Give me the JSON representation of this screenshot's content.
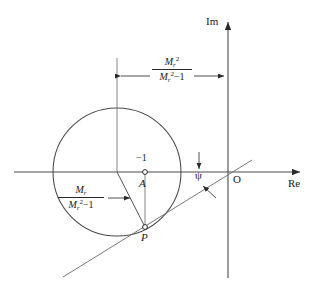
{
  "figure": {
    "background": "#ffffff",
    "stroke_color": "#3a3a3a",
    "text_color": "#1a1a1a"
  },
  "axes": {
    "imaginary": {
      "label": "Im",
      "arrow": "up-arrow-icon"
    },
    "real": {
      "label": "Re",
      "arrow": "right-arrow-icon"
    },
    "origin_label": "O"
  },
  "points": {
    "center": {
      "label": "A",
      "value_label": "−1",
      "marker": "open-circle"
    },
    "tangent": {
      "label": "P",
      "marker": "open-circle"
    }
  },
  "angle": {
    "symbol": "ψ"
  },
  "dimensions": {
    "horizontal": {
      "numerator_base": "M",
      "numerator_sub": "r",
      "numerator_sup": "2",
      "denominator_base": "M",
      "denominator_sub": "r",
      "denominator_sup": "2",
      "denominator_tail": "−1",
      "meaning": "M_r^2 / (M_r^2 - 1)"
    },
    "radius": {
      "numerator_base": "M",
      "numerator_sub": "r",
      "denominator_base": "M",
      "denominator_sub": "r",
      "denominator_sup": "2",
      "denominator_tail": "−1",
      "meaning": "M_r / (M_r^2 - 1)"
    }
  },
  "geometry": {
    "circle": {
      "cx": 117,
      "cy": 172,
      "r": 64
    },
    "center_point": {
      "x": 117,
      "y": 172
    },
    "minus_one_point": {
      "x": 145,
      "y": 172
    },
    "tangent_point": {
      "x": 145,
      "y": 227
    },
    "im_axis_x": 228,
    "re_axis_y": 172
  }
}
